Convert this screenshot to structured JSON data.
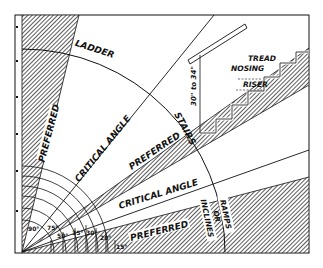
{
  "diagram": {
    "colors": {
      "ink": "#111111",
      "paper": "#ffffff",
      "hatch": "#444444"
    },
    "regions": {
      "ladder": {
        "label": "LADDER",
        "preferred": "PREFERRED"
      },
      "ladder_stairs_boundary": {
        "label": "CRITICAL ANGLE"
      },
      "stairs": {
        "label": "STAIRS",
        "preferred": "PREFERRED"
      },
      "stairs_ramp_boundary": {
        "label": "CRITICAL ANGLE"
      },
      "ramps": {
        "label_line1": "RAMPS",
        "label_line2": "OR",
        "label_line3": "INCLINES",
        "preferred": "PREFERRED"
      }
    },
    "stair_detail": {
      "tread": "TREAD",
      "nosing": "NOSING",
      "riser": "RISER",
      "handrail_height": "30\" to 34\""
    },
    "angles": [
      "90°",
      "75°",
      "50°",
      "35°",
      "30°",
      "20°",
      "15°"
    ]
  }
}
